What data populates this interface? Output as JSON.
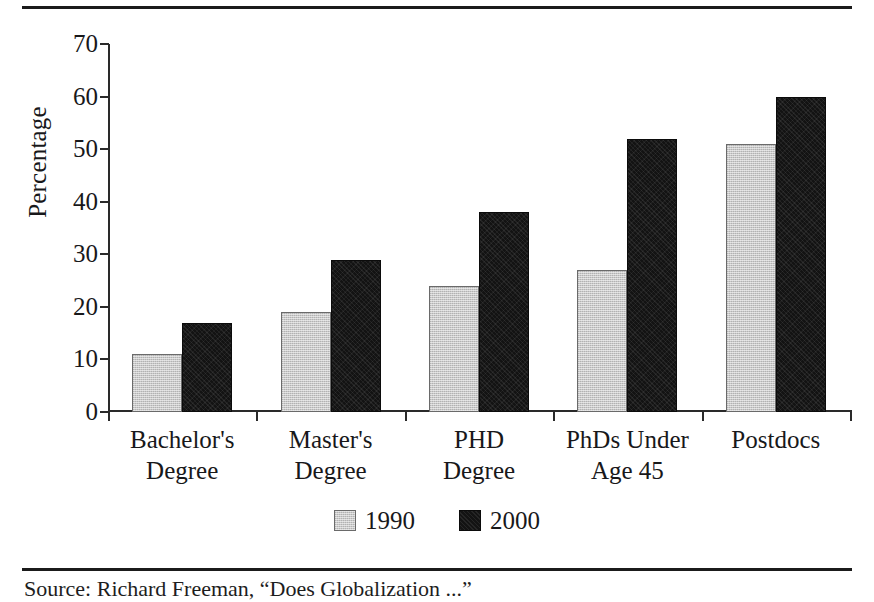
{
  "figure": {
    "has_top_rule": true,
    "has_bottom_rule": true,
    "source_caption": "Source: Richard Freeman, “Does Globalization ...”"
  },
  "axis": {
    "y_title": "Percentage",
    "y_ticks": [
      "70",
      "60",
      "50",
      "40",
      "30",
      "20",
      "10",
      "0"
    ]
  },
  "legend": {
    "items": [
      {
        "label": "1990",
        "swatch": "gray-swatch-icon",
        "color": "#c9c9c9"
      },
      {
        "label": "2000",
        "swatch": "black-swatch-icon",
        "color": "#131313"
      }
    ]
  },
  "categories_display": [
    {
      "line1": "Bachelor's",
      "line2": "Degree"
    },
    {
      "line1": "Master's",
      "line2": "Degree"
    },
    {
      "line1": "PHD",
      "line2": "Degree"
    },
    {
      "line1": "PhDs Under",
      "line2": "Age 45"
    },
    {
      "line1": "Postdocs",
      "line2": ""
    }
  ],
  "chart_data": {
    "type": "bar",
    "title": "",
    "xlabel": "",
    "ylabel": "Percentage",
    "ylim": [
      0,
      70
    ],
    "ytick_step": 10,
    "grid": false,
    "legend_position": "bottom",
    "categories": [
      "Bachelor's Degree",
      "Master's Degree",
      "PHD Degree",
      "PhDs Under Age 45",
      "Postdocs"
    ],
    "series": [
      {
        "name": "1990",
        "color": "#c9c9c9",
        "values": [
          11,
          19,
          24,
          27,
          51
        ]
      },
      {
        "name": "2000",
        "color": "#131313",
        "values": [
          17,
          29,
          38,
          52,
          60
        ]
      }
    ]
  }
}
